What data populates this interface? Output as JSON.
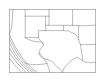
{
  "figure": {
    "title": "",
    "kind": "map-thumbnail",
    "background_color": "#ffffff",
    "frame_color": "#9a9a9a",
    "line_color": "#8d8d8d",
    "width_px": 105,
    "height_px": 82
  },
  "frame": {
    "x": 9,
    "y": 9,
    "width": 87,
    "height": 64
  },
  "regions": [
    {
      "name": "texas",
      "label": "Texas",
      "path": "M 38,36 L 38,30 L 63,30 L 63,25 L 70,25 L 70,29 L 76,31 L 80,36 L 82,42 L 84,46 L 87,52 L 88,58 L 84,60 L 80,59 L 76,62 L 73,66 L 69,68 L 64,70 L 58,70 L 52,69 L 47,66 L 43,62 L 40,57 L 38,52 L 41,48 L 44,45 L 43,41 L 40,38 Z"
    },
    {
      "name": "new-mexico",
      "label": "New Mexico",
      "path": "M 24,16 L 24,37 L 39,37 L 39,30 L 45,30 L 45,16 Z"
    },
    {
      "name": "colorado",
      "label": "Colorado",
      "path": "M 24,16 L 24,12 L 48,12 L 48,16 Z"
    },
    {
      "name": "oklahoma-panhandle",
      "label": "Oklahoma",
      "path": "M 45,26 L 63,26 L 63,30 L 70,30 L 70,25 L 45,25 Z"
    },
    {
      "name": "arizona",
      "label": "Arizona",
      "path": "M 12,14 L 12,38 L 24,38 L 24,14 Z"
    },
    {
      "name": "kansas",
      "label": "Kansas",
      "path": "M 48,12 L 72,12 L 72,26 L 48,26 Z"
    },
    {
      "name": "arkansas-louisiana",
      "label": "Arkansas / Louisiana",
      "path": "M 76,26 L 88,26 L 88,52 L 80,52 L 78,42 Z"
    },
    {
      "name": "northern-mexico",
      "label": "Northern Mexico",
      "path": "M 10,34 L 14,40 L 18,48 L 22,56 L 27,64 L 32,70 L 38,73"
    }
  ],
  "icons": {
    "map": "map-icon"
  }
}
